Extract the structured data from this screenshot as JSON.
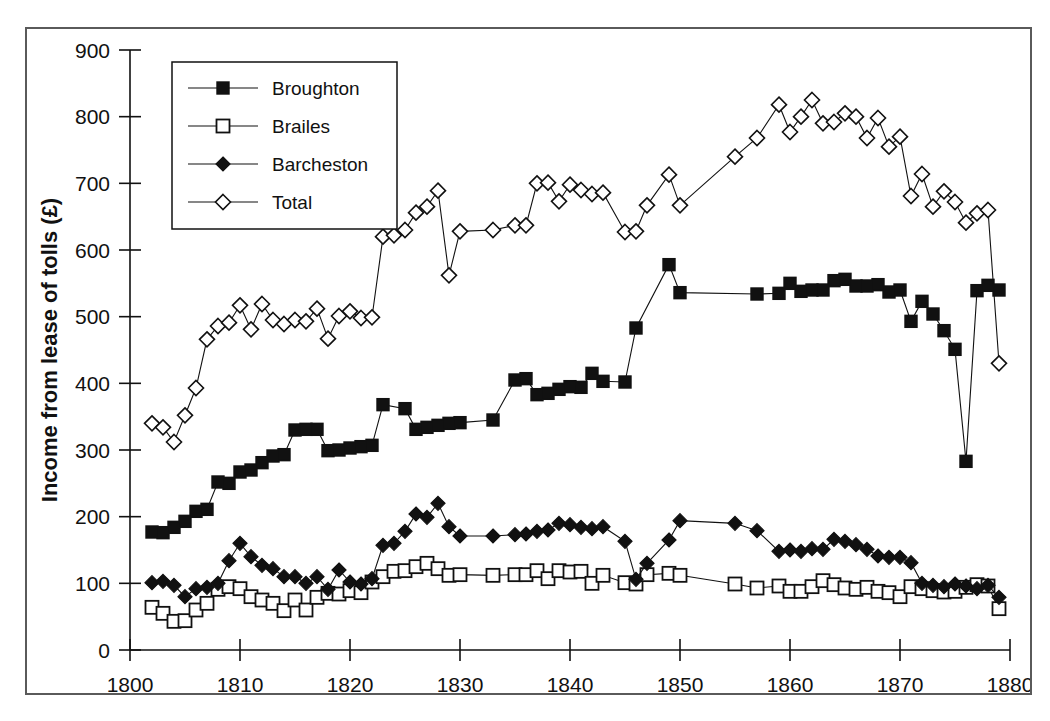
{
  "chart_data": {
    "type": "line",
    "title": "",
    "xlabel": "",
    "ylabel": "Income from lease of tolls (£)",
    "xlim": [
      1800,
      1880
    ],
    "ylim": [
      0,
      900
    ],
    "xticks": [
      1800,
      1810,
      1820,
      1830,
      1840,
      1850,
      1860,
      1870,
      1880
    ],
    "yticks": [
      0,
      100,
      200,
      300,
      400,
      500,
      600,
      700,
      800,
      900
    ],
    "grid": false,
    "legend_position": "top-left",
    "series": [
      {
        "name": "Broughton",
        "marker": "filled-square",
        "x": [
          1802,
          1803,
          1804,
          1805,
          1806,
          1807,
          1808,
          1809,
          1810,
          1811,
          1812,
          1813,
          1814,
          1815,
          1816,
          1817,
          1818,
          1819,
          1820,
          1821,
          1822,
          1823,
          1825,
          1826,
          1827,
          1828,
          1829,
          1830,
          1833,
          1835,
          1836,
          1837,
          1838,
          1839,
          1840,
          1841,
          1842,
          1843,
          1845,
          1846,
          1849,
          1850,
          1857,
          1859,
          1860,
          1861,
          1862,
          1863,
          1864,
          1865,
          1866,
          1867,
          1868,
          1869,
          1870,
          1871,
          1872,
          1873,
          1874,
          1875,
          1876,
          1877,
          1878,
          1879
        ],
        "y": [
          177,
          176,
          184,
          193,
          208,
          211,
          252,
          250,
          267,
          270,
          281,
          291,
          293,
          330,
          331,
          331,
          299,
          300,
          303,
          305,
          307,
          368,
          362,
          331,
          334,
          337,
          340,
          341,
          345,
          405,
          407,
          383,
          385,
          391,
          395,
          394,
          415,
          403,
          402,
          483,
          578,
          536,
          534,
          535,
          550,
          538,
          540,
          540,
          554,
          556,
          546,
          546,
          548,
          537,
          540,
          493,
          523,
          504,
          479,
          451,
          283,
          539,
          547,
          540
        ],
        "note": "Income in £ from lease of tolls at Broughton gate"
      },
      {
        "name": "Brailes",
        "marker": "open-square",
        "x": [
          1802,
          1803,
          1804,
          1805,
          1806,
          1807,
          1808,
          1809,
          1810,
          1811,
          1812,
          1813,
          1814,
          1815,
          1816,
          1817,
          1818,
          1819,
          1820,
          1821,
          1822,
          1823,
          1824,
          1825,
          1826,
          1827,
          1828,
          1829,
          1830,
          1833,
          1835,
          1836,
          1837,
          1838,
          1839,
          1840,
          1841,
          1842,
          1843,
          1845,
          1846,
          1847,
          1849,
          1850,
          1855,
          1857,
          1859,
          1860,
          1861,
          1862,
          1863,
          1864,
          1865,
          1866,
          1867,
          1868,
          1869,
          1870,
          1871,
          1872,
          1873,
          1874,
          1875,
          1876,
          1877,
          1878,
          1879
        ],
        "y": [
          64,
          55,
          43,
          44,
          60,
          70,
          91,
          95,
          92,
          80,
          75,
          70,
          59,
          75,
          60,
          79,
          85,
          84,
          89,
          86,
          102,
          110,
          118,
          119,
          125,
          130,
          122,
          112,
          113,
          112,
          113,
          113,
          119,
          107,
          119,
          117,
          118,
          100,
          112,
          101,
          99,
          113,
          115,
          112,
          99,
          93,
          96,
          88,
          88,
          95,
          104,
          98,
          93,
          91,
          94,
          88,
          86,
          80,
          95,
          92,
          89,
          87,
          88,
          94,
          98,
          96,
          62
        ],
        "note": "Income in £ from lease of tolls at Brailes gate"
      },
      {
        "name": "Barcheston",
        "marker": "filled-diamond",
        "x": [
          1802,
          1803,
          1804,
          1805,
          1806,
          1807,
          1808,
          1809,
          1810,
          1811,
          1812,
          1813,
          1814,
          1815,
          1816,
          1817,
          1818,
          1819,
          1820,
          1821,
          1822,
          1823,
          1824,
          1825,
          1826,
          1827,
          1828,
          1829,
          1830,
          1833,
          1835,
          1836,
          1837,
          1838,
          1839,
          1840,
          1841,
          1842,
          1843,
          1845,
          1846,
          1847,
          1849,
          1850,
          1855,
          1857,
          1859,
          1860,
          1861,
          1862,
          1863,
          1864,
          1865,
          1866,
          1867,
          1868,
          1869,
          1870,
          1871,
          1872,
          1873,
          1874,
          1875,
          1876,
          1877,
          1878,
          1879
        ],
        "y": [
          101,
          103,
          97,
          80,
          92,
          94,
          100,
          134,
          160,
          140,
          127,
          122,
          110,
          110,
          100,
          110,
          91,
          120,
          102,
          99,
          107,
          157,
          160,
          178,
          204,
          199,
          220,
          185,
          171,
          171,
          173,
          174,
          178,
          180,
          190,
          188,
          184,
          182,
          185,
          163,
          106,
          130,
          165,
          194,
          190,
          179,
          148,
          150,
          148,
          152,
          151,
          166,
          163,
          158,
          151,
          141,
          139,
          139,
          131,
          100,
          97,
          95,
          99,
          96,
          92,
          97,
          79
        ],
        "note": "Income in £ from lease of tolls at Barcheston gate"
      },
      {
        "name": "Total",
        "marker": "open-diamond",
        "x": [
          1802,
          1803,
          1804,
          1805,
          1806,
          1807,
          1808,
          1809,
          1810,
          1811,
          1812,
          1813,
          1814,
          1815,
          1816,
          1817,
          1818,
          1819,
          1820,
          1821,
          1822,
          1823,
          1824,
          1825,
          1826,
          1827,
          1828,
          1829,
          1830,
          1833,
          1835,
          1836,
          1837,
          1838,
          1839,
          1840,
          1841,
          1842,
          1843,
          1845,
          1846,
          1847,
          1849,
          1850,
          1855,
          1857,
          1859,
          1860,
          1861,
          1862,
          1863,
          1864,
          1865,
          1866,
          1867,
          1868,
          1869,
          1870,
          1871,
          1872,
          1873,
          1874,
          1875,
          1876,
          1877,
          1878,
          1879
        ],
        "y": [
          340,
          334,
          312,
          352,
          393,
          466,
          486,
          491,
          517,
          481,
          519,
          495,
          489,
          495,
          493,
          512,
          467,
          501,
          508,
          498,
          499,
          620,
          622,
          630,
          656,
          665,
          689,
          562,
          628,
          630,
          637,
          637,
          700,
          701,
          673,
          698,
          690,
          684,
          686,
          627,
          628,
          667,
          713,
          667,
          740,
          768,
          818,
          777,
          800,
          825,
          790,
          792,
          805,
          800,
          768,
          798,
          755,
          770,
          681,
          714,
          665,
          688,
          672,
          641,
          655,
          660,
          430
        ],
        "note": "Sum of the three gates; plotted as open diamonds"
      }
    ]
  },
  "legend": {
    "items": [
      {
        "label": "Broughton",
        "marker": "filled-square"
      },
      {
        "label": "Brailes",
        "marker": "open-square"
      },
      {
        "label": "Barcheston",
        "marker": "filled-diamond"
      },
      {
        "label": "Total",
        "marker": "open-diamond"
      }
    ]
  },
  "axes": {
    "y_title": "Income from lease of tolls (£)",
    "y_ticks": [
      "900",
      "800",
      "700",
      "600",
      "500",
      "400",
      "300",
      "200",
      "100",
      "0"
    ],
    "x_ticks": [
      "1800",
      "1810",
      "1820",
      "1830",
      "1840",
      "1850",
      "1860",
      "1870",
      "1880"
    ]
  },
  "colors": {
    "ink": "#111111",
    "frame": "#5a5a5a",
    "background": "#ffffff"
  }
}
